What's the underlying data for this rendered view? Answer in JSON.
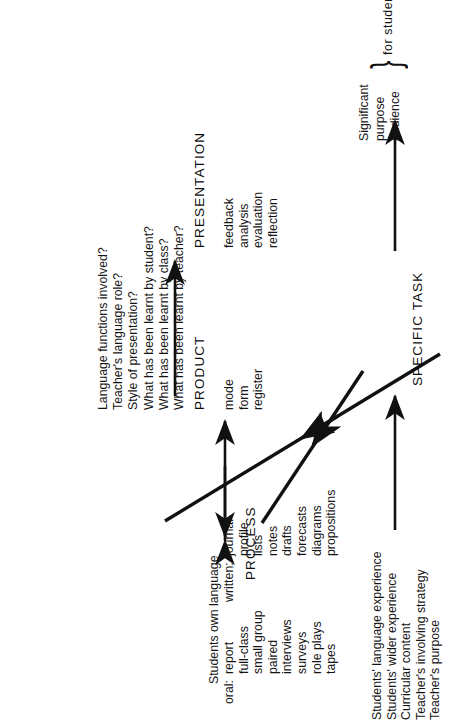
{
  "figure": {
    "orientation": "rotated-90-ccw"
  },
  "inputs": {
    "items": [
      "Students' language experience",
      "Students' wider experience",
      "Curricular content",
      "Teacher's involving strategy",
      "Teacher's purpose"
    ]
  },
  "stages": {
    "specific_task": "SPECIFIC TASK",
    "process": "PROCESS",
    "product": "PRODUCT",
    "presentation": "PRESENTATION"
  },
  "significant": {
    "lines": [
      "Significant",
      "purpose",
      "audience"
    ],
    "brace": "}",
    "for_whom": "for student"
  },
  "process_block": {
    "heading": "Students own language",
    "oral_label": "oral:",
    "oral_items": [
      "report",
      "full-class",
      "small group",
      "paired",
      "interviews",
      "surveys",
      "role plays",
      "tapes"
    ],
    "written_label": "written:",
    "written_items": [
      "journal",
      "profile",
      "lists",
      "notes",
      "drafts",
      "forecasts",
      "diagrams",
      "propositions"
    ]
  },
  "product_block": {
    "items": [
      "mode",
      "form",
      "register"
    ]
  },
  "presentation_block": {
    "items": [
      "feedback",
      "analysis",
      "evaluation",
      "reflection"
    ]
  },
  "questions": {
    "items": [
      "Language functions involved?",
      "Teacher's language role?",
      "Style of presentation?",
      "What has been learnt by student?",
      "What has been learnt by class?",
      "What has been learnt by teacher?"
    ]
  },
  "colors": {
    "ink": "#111111",
    "paper": "#ffffff"
  }
}
